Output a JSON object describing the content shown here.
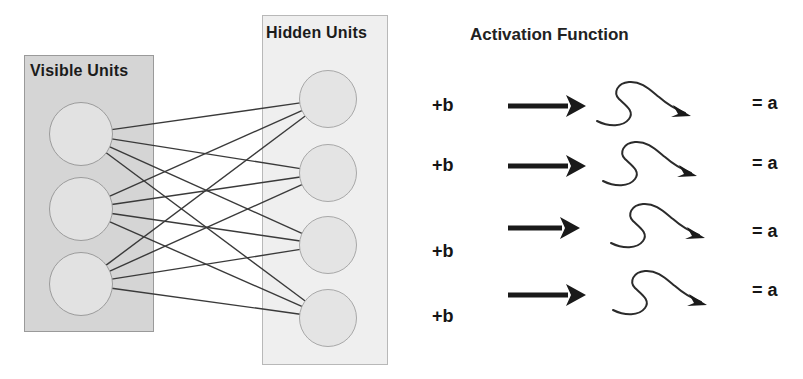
{
  "diagram": {
    "title_hidden": "Hidden Units",
    "title_visible": "Visible Units",
    "activation_title": "Activation Function",
    "colors": {
      "visible_box_fill": "#d5d5d5",
      "visible_box_stroke": "#9a9a9a",
      "hidden_box_fill": "#efefef",
      "hidden_box_stroke": "#b8b8b8",
      "unit_fill": "#e2e2e2",
      "unit_stroke": "#9c9c9c",
      "edge_stroke": "#3a3a3a",
      "text": "#1b1b1b"
    }
  },
  "visible_layer": {
    "label": "Visible Units",
    "unit_count": 3,
    "units": [
      {
        "name": "visible-unit-1",
        "cx": 81,
        "cy": 134,
        "r": 32
      },
      {
        "name": "visible-unit-2",
        "cx": 81,
        "cy": 209,
        "r": 32
      },
      {
        "name": "visible-unit-3",
        "cx": 81,
        "cy": 284,
        "r": 32
      }
    ]
  },
  "hidden_layer": {
    "label": "Hidden Units",
    "unit_count": 4,
    "units": [
      {
        "name": "hidden-unit-1",
        "cx": 328,
        "cy": 99,
        "r": 29
      },
      {
        "name": "hidden-unit-2",
        "cx": 328,
        "cy": 173,
        "r": 29
      },
      {
        "name": "hidden-unit-3",
        "cx": 328,
        "cy": 245,
        "r": 29
      },
      {
        "name": "hidden-unit-4",
        "cx": 328,
        "cy": 318,
        "r": 29
      }
    ]
  },
  "connections": {
    "description": "fully connected bipartite edges, visible unit index to hidden unit index",
    "edges": [
      [
        0,
        0
      ],
      [
        0,
        1
      ],
      [
        0,
        2
      ],
      [
        0,
        3
      ],
      [
        1,
        0
      ],
      [
        1,
        1
      ],
      [
        1,
        2
      ],
      [
        1,
        3
      ],
      [
        2,
        0
      ],
      [
        2,
        1
      ],
      [
        2,
        2
      ],
      [
        2,
        3
      ]
    ]
  },
  "activation": {
    "title": "Activation Function",
    "rows": [
      {
        "bias_label": "+b",
        "result_label": "= a",
        "y": 105,
        "arrow_len": 64,
        "arrow_y_offset": 0
      },
      {
        "bias_label": "+b",
        "result_label": "= a",
        "y": 165,
        "arrow_len": 64,
        "arrow_y_offset": 0
      },
      {
        "bias_label": "+b",
        "result_label": "= a",
        "y": 237,
        "arrow_len": 58,
        "arrow_y_offset": -10
      },
      {
        "bias_label": "+b",
        "result_label": "= a",
        "y": 302,
        "arrow_len": 64,
        "arrow_y_offset": -8
      }
    ]
  }
}
